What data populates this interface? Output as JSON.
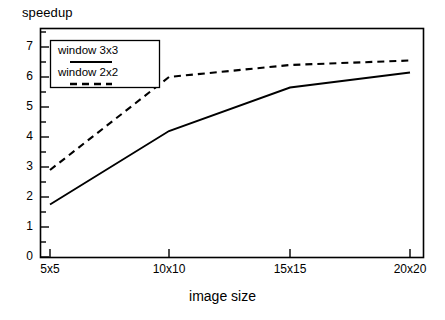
{
  "chart_data": {
    "type": "line",
    "title": "",
    "xlabel": "image size",
    "ylabel": "speedup",
    "categories": [
      "5x5",
      "10x10",
      "15x15",
      "20x20"
    ],
    "ylim": [
      0,
      7.6
    ],
    "yticks": [
      0,
      1,
      2,
      3,
      4,
      5,
      6,
      7
    ],
    "ytick_labels": [
      "0",
      "1",
      "2",
      "3",
      "4",
      "5",
      "6",
      "7"
    ],
    "minor_ticks": true,
    "grid": false,
    "legend_position": "upper-left",
    "series": [
      {
        "name": "window 3x3",
        "style": "solid",
        "color": "#000000",
        "values": [
          1.75,
          4.2,
          5.65,
          6.15
        ]
      },
      {
        "name": "window 2x2",
        "style": "dashed",
        "color": "#000000",
        "values": [
          2.9,
          6.0,
          6.4,
          6.55
        ]
      }
    ]
  },
  "legend": {
    "items": [
      {
        "label": "window 3x3",
        "style": "solid"
      },
      {
        "label": "window 2x2",
        "style": "dashed"
      }
    ]
  },
  "axes": {
    "y_axis_title": "speedup",
    "x_axis_title": "image size"
  }
}
